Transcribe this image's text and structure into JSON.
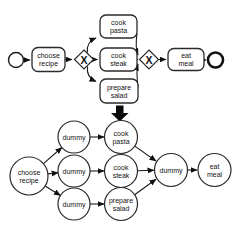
{
  "colors": {
    "background": "#ffffff",
    "node_fill": "#ffffff",
    "dummy_fill": "#c1c1c1",
    "stroke": "#1c1c1c",
    "transform_arrow_fill": "#0a0a0a"
  },
  "bpmn": {
    "gateways": {
      "split_symbol": "X",
      "join_symbol": "X"
    },
    "tasks": {
      "choose_recipe": {
        "line1": "choose",
        "line2": "recipe"
      },
      "cook_pasta": {
        "line1": "cook",
        "line2": "pasta"
      },
      "cook_steak": {
        "line1": "cook",
        "line2": "steak"
      },
      "prepare_salad": {
        "line1": "prepare",
        "line2": "salad"
      },
      "eat_meal": {
        "line1": "eat",
        "line2": "meal"
      }
    }
  },
  "net": {
    "nodes": {
      "choose_recipe": {
        "line1": "choose",
        "line2": "recipe"
      },
      "dummy_top": {
        "label": "dummy"
      },
      "dummy_mid": {
        "label": "dummy"
      },
      "dummy_bottom": {
        "label": "dummy"
      },
      "cook_pasta": {
        "line1": "cook",
        "line2": "pasta"
      },
      "cook_steak": {
        "line1": "cook",
        "line2": "steak"
      },
      "prepare_salad": {
        "line1": "prepare",
        "line2": "salad"
      },
      "dummy_join": {
        "label": "dummy"
      },
      "eat_meal": {
        "line1": "eat",
        "line2": "meal"
      }
    }
  }
}
